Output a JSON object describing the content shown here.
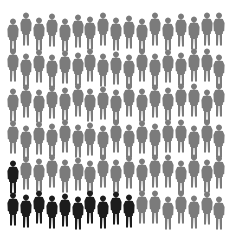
{
  "chart_data": {
    "type": "table",
    "subtype": "icon-array-pictogram",
    "title": "",
    "rows": 6,
    "columns": 17,
    "total_icons": 102,
    "highlighted_count": 11,
    "icon": "person-figure-icon",
    "colors": {
      "highlighted": "#1c1c1c",
      "default": "#7b7b7b"
    },
    "highlighted_positions": [
      {
        "row": 5,
        "col": 1
      },
      {
        "row": 6,
        "col": 1
      },
      {
        "row": 6,
        "col": 2
      },
      {
        "row": 6,
        "col": 3
      },
      {
        "row": 6,
        "col": 4
      },
      {
        "row": 6,
        "col": 5
      },
      {
        "row": 6,
        "col": 6
      },
      {
        "row": 6,
        "col": 7
      },
      {
        "row": 6,
        "col": 8
      },
      {
        "row": 6,
        "col": 9
      },
      {
        "row": 6,
        "col": 10
      }
    ],
    "legend": []
  }
}
